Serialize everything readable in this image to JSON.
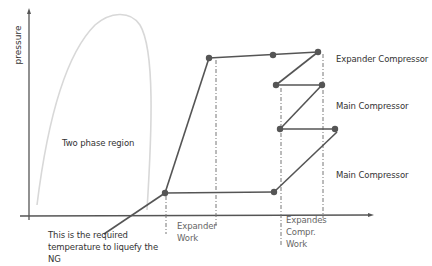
{
  "diagram": {
    "title": "",
    "y_axis_label": "pressure",
    "region_label": "Two phase region",
    "note": "This is the required temperature to liquefy the NG",
    "stage_labels": [
      {
        "text": "Expander Compressor"
      },
      {
        "text": "Main Compressor"
      },
      {
        "text": "Main Compressor"
      }
    ],
    "work_labels": [
      {
        "text": "Expander\nWork",
        "line1": "Expander",
        "line2": "Work"
      },
      {
        "text": "Expandes Compr. Work",
        "line1": "Expandes",
        "line2": "Compr.",
        "line3": "Work"
      }
    ],
    "colors": {
      "axis": "#555555",
      "process_line": "#555555",
      "dome": "#d8d8d8",
      "point": "#555555",
      "dashed": "#777777"
    },
    "points": [
      {
        "x": 165,
        "y": 193
      },
      {
        "x": 209,
        "y": 58
      },
      {
        "x": 273,
        "y": 55
      },
      {
        "x": 318,
        "y": 52
      },
      {
        "x": 276,
        "y": 85
      },
      {
        "x": 322,
        "y": 85
      },
      {
        "x": 280,
        "y": 129
      },
      {
        "x": 335,
        "y": 129
      },
      {
        "x": 274,
        "y": 192
      }
    ]
  }
}
